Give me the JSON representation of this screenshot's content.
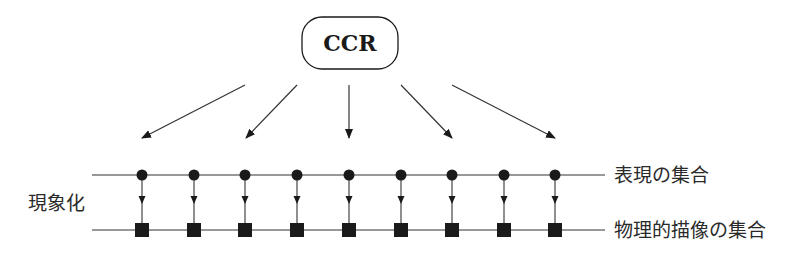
{
  "diagram": {
    "root_node": {
      "label": "CCR"
    },
    "left_label": "現象化",
    "top_set_label": "表現の集合",
    "bottom_set_label": "物理的描像の集合",
    "colors": {
      "ink": "#1a1a1a",
      "line": "#333333",
      "background": "#ffffff"
    },
    "representation_nodes": {
      "count": 9,
      "shape": "circle"
    },
    "physical_nodes": {
      "count": 9,
      "shape": "square"
    },
    "fan_arrows": {
      "count": 5
    }
  }
}
